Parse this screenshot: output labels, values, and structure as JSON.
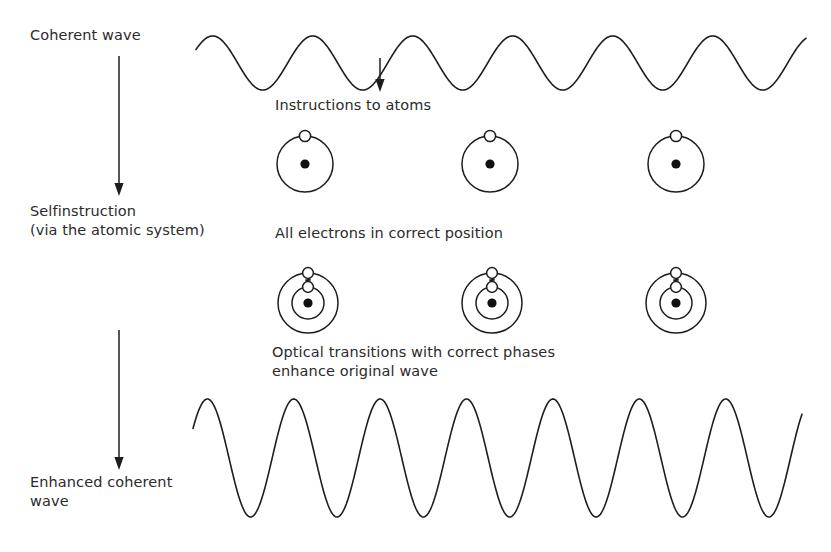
{
  "figure": {
    "background_color": "#ffffff",
    "ink_color": "#1d1d1d",
    "width": 831,
    "height": 552
  },
  "stage_labels": [
    {
      "id": "coherent-wave",
      "text": "Coherent wave",
      "x": 30,
      "y": 33
    },
    {
      "id": "selfinstruction",
      "line1": "Selfinstruction",
      "line2": "(via the atomic system)",
      "x": 30,
      "y": 209
    },
    {
      "id": "enhanced-coherent-wave",
      "line1": "Enhanced coherent",
      "line2": "wave",
      "x": 30,
      "y": 480
    }
  ],
  "flow_arrows": [
    {
      "id": "arrow-coherent-to-self",
      "x": 119,
      "y_start": 56,
      "y_end": 196,
      "direction": "down"
    },
    {
      "id": "arrow-self-to-enhanced",
      "x": 119,
      "y_start": 330,
      "y_end": 470,
      "direction": "down"
    },
    {
      "id": "arrow-wave-to-atoms",
      "x": 380,
      "y_start": 58,
      "y_end": 92,
      "direction": "down"
    }
  ],
  "captions": [
    {
      "id": "instructions-to-atoms",
      "text": "Instructions to atoms",
      "x": 275,
      "y": 104
    },
    {
      "id": "all-electrons-correct",
      "text": "All electrons in correct position",
      "x": 275,
      "y": 232
    },
    {
      "id": "optical-transitions",
      "line1": "Optical transitions with correct phases",
      "line2": "enhance original wave",
      "x": 272,
      "y": 350
    }
  ],
  "waves": {
    "top": {
      "id": "coherent-wave-curve",
      "label": "Coherent wave",
      "x_start": 196,
      "x_end": 806,
      "baseline_y": 63,
      "amplitude": 27,
      "cycles": 6.1,
      "phase_deg": 30,
      "description": "low amplitude sinusoid, six full cycles"
    },
    "bottom": {
      "id": "enhanced-wave-curve",
      "label": "Enhanced coherent wave",
      "x_start": 193,
      "x_end": 802,
      "baseline_y": 458,
      "amplitude": 59,
      "cycles": 7.05,
      "phase_deg": 30,
      "description": "high amplitude sinusoid, seven full cycles"
    }
  },
  "atom_rows": [
    {
      "id": "atom-row-instructed",
      "caption_ref": "instructions-to-atoms",
      "center_y": 164,
      "orbits": [
        28
      ],
      "nucleus_radius": 4.6,
      "electron_radius": 5.6,
      "electron_on_orbit_index": 0,
      "has_transition": false,
      "atoms": [
        {
          "id": "atom-1",
          "cx": 305
        },
        {
          "id": "atom-2",
          "cx": 490
        },
        {
          "id": "atom-3",
          "cx": 676
        }
      ]
    },
    {
      "id": "atom-row-transition",
      "caption_ref": "all-electrons-correct",
      "center_y": 303,
      "orbits": [
        30,
        16
      ],
      "nucleus_radius": 4.6,
      "electron_radius": 5.4,
      "has_transition": true,
      "transition_label": "optical transition (photon)",
      "atoms": [
        {
          "id": "atom-4",
          "cx": 308
        },
        {
          "id": "atom-5",
          "cx": 492
        },
        {
          "id": "atom-6",
          "cx": 676
        }
      ]
    }
  ],
  "legend_notes": {
    "nucleus": "filled black dot at atom center",
    "electron": "hollow white circle on orbit",
    "photon": "zigzag line between outer and inner electron"
  }
}
